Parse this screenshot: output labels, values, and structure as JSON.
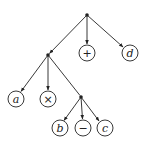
{
  "diagram": {
    "type": "tree",
    "nodes": [
      {
        "id": "root",
        "kind": "branch",
        "x": 87,
        "y": 15
      },
      {
        "id": "n1",
        "kind": "branch",
        "x": 48,
        "y": 55
      },
      {
        "id": "plus",
        "kind": "leaf",
        "label": "+",
        "style": "op",
        "x": 87,
        "y": 53
      },
      {
        "id": "d",
        "kind": "leaf",
        "label": "d",
        "style": "var",
        "x": 130,
        "y": 53
      },
      {
        "id": "a",
        "kind": "leaf",
        "label": "a",
        "style": "var",
        "x": 16,
        "y": 99
      },
      {
        "id": "times",
        "kind": "leaf",
        "label": "×",
        "style": "op",
        "x": 48,
        "y": 99
      },
      {
        "id": "n2",
        "kind": "branch",
        "x": 81,
        "y": 97
      },
      {
        "id": "b",
        "kind": "leaf",
        "label": "b",
        "style": "var",
        "x": 60,
        "y": 128
      },
      {
        "id": "minus",
        "kind": "leaf",
        "label": "−",
        "style": "op",
        "x": 83,
        "y": 128
      },
      {
        "id": "c",
        "kind": "leaf",
        "label": "c",
        "style": "var",
        "x": 105,
        "y": 128
      }
    ],
    "edges": [
      [
        "root",
        "n1"
      ],
      [
        "root",
        "plus"
      ],
      [
        "root",
        "d"
      ],
      [
        "n1",
        "a"
      ],
      [
        "n1",
        "times"
      ],
      [
        "n1",
        "n2"
      ],
      [
        "n2",
        "b"
      ],
      [
        "n2",
        "minus"
      ],
      [
        "n2",
        "c"
      ]
    ],
    "colors": {
      "stroke": "#222222",
      "background": "#ffffff"
    }
  },
  "labels": {
    "plus": "+",
    "d": "d",
    "a": "a",
    "times": "×",
    "b": "b",
    "minus": "−",
    "c": "c"
  }
}
